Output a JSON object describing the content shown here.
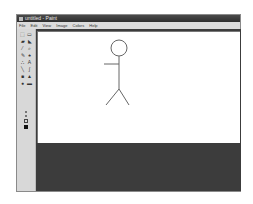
{
  "window": {
    "title": "untitled - Paint"
  },
  "menubar": {
    "items": [
      "File",
      "Edit",
      "View",
      "Image",
      "Colors",
      "Help"
    ]
  },
  "toolbox": {
    "tools": [
      {
        "name": "free-form-select",
        "glyph": "⬚"
      },
      {
        "name": "select",
        "glyph": "▭"
      },
      {
        "name": "eraser",
        "glyph": "▰"
      },
      {
        "name": "fill",
        "glyph": "◣"
      },
      {
        "name": "pick-color",
        "glyph": "⁄"
      },
      {
        "name": "magnifier",
        "glyph": "⌕"
      },
      {
        "name": "pencil",
        "glyph": "✎"
      },
      {
        "name": "brush",
        "glyph": "♠"
      },
      {
        "name": "airbrush",
        "glyph": "∴"
      },
      {
        "name": "text",
        "glyph": "A"
      },
      {
        "name": "line",
        "glyph": "╲"
      },
      {
        "name": "curve",
        "glyph": "∫"
      },
      {
        "name": "rectangle",
        "glyph": "■"
      },
      {
        "name": "polygon",
        "glyph": "▲"
      },
      {
        "name": "ellipse",
        "glyph": "●"
      },
      {
        "name": "rounded-rectangle",
        "glyph": "▬"
      }
    ]
  },
  "canvas": {
    "drawing": "stick figure",
    "stroke_color": "#666666",
    "background": "#ffffff"
  },
  "colors": {
    "titlebar": "#3a3a3a",
    "menubar": "#dcdcdc",
    "workspace": "#3c3c3c"
  }
}
